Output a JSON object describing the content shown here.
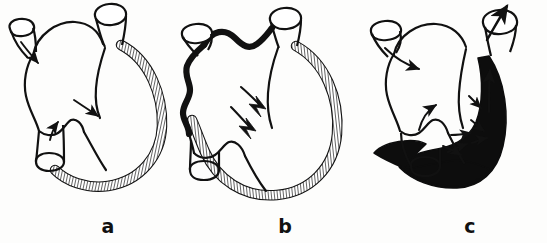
{
  "figure": {
    "background_color": "#fdfdfc",
    "ink_color": "#111111",
    "panels": [
      {
        "id": "a",
        "label": "a",
        "label_x": 108,
        "label_y": 233,
        "caption_name": "normal-heart",
        "wall_style": "hatched",
        "wall_fill": "#ffffff",
        "hatch_color": "#111111",
        "arrow_count": 3,
        "arrow_style": "smooth-curved",
        "vessels": [
          "superior-left-vessel",
          "upper-right-vessel",
          "lower-left-vessel"
        ]
      },
      {
        "id": "b",
        "label": "b",
        "label_x": 285,
        "label_y": 233,
        "caption_name": "dilated-heart",
        "wall_style": "hatched",
        "wall_fill": "#ffffff",
        "hatch_color": "#111111",
        "atrial_border_style": "thick-wavy-black",
        "arrow_count": 2,
        "arrow_style": "jagged-lightning",
        "vessels": [
          "superior-left-vessel",
          "upper-right-vessel",
          "lower-left-vessel"
        ]
      },
      {
        "id": "c",
        "label": "c",
        "label_x": 470,
        "label_y": 233,
        "caption_name": "hypertrophied-heart",
        "wall_style": "solid-filled",
        "wall_fill": "#0d0d0d",
        "arrow_count": 8,
        "arrow_style": "converging-arrowheads",
        "outflow_arrow": "upward-through-aorta",
        "vessels": [
          "superior-left-vessel",
          "upper-right-vessel",
          "lower-left-vessel"
        ]
      }
    ]
  }
}
